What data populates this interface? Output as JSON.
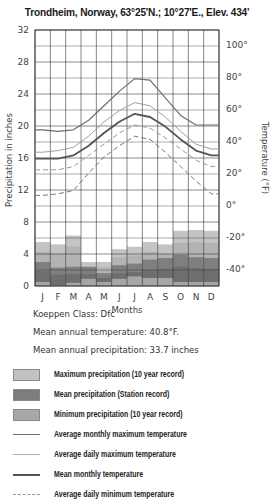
{
  "title": "Trondheim, Norway, 63°25'N.; 10°27'E., Elev. 434'",
  "info": {
    "koeppen": "Koeppen Class: Dfc",
    "mean_temp": "Mean annual temperature: 40.8°F.",
    "mean_precip": "Mean annual precipitation: 33.7 inches"
  },
  "legend": [
    {
      "label": "Maximum precipitation  (10 year record)",
      "kind": "swatch",
      "color": "#c2c2c2"
    },
    {
      "label": "Mean precipitation  (Station record)",
      "kind": "swatch",
      "color": "#7d7d7d"
    },
    {
      "label": "Minimum precipitation  (10 year record)",
      "kind": "swatch",
      "color": "#a8a8a8"
    },
    {
      "label": "Average monthly maximum temperature",
      "kind": "line",
      "color": "#6e6e6e",
      "width": 1.2,
      "dash": ""
    },
    {
      "label": "Average daily maximum temperature",
      "kind": "line",
      "color": "#a0a0a0",
      "width": 1,
      "dash": ""
    },
    {
      "label": "Mean monthly temperature",
      "kind": "line",
      "color": "#555555",
      "width": 1.8,
      "dash": ""
    },
    {
      "label": "Average daily minimum temperature",
      "kind": "line",
      "color": "#999999",
      "width": 1,
      "dash": "5,3"
    }
  ],
  "chart_data": {
    "type": "bar+line",
    "title": "Trondheim, Norway, 63°25'N.; 10°27'E., Elev. 434'",
    "xlabel": "Months",
    "ylabel": "Precipitation in inches",
    "y2label": "Temperature (°F)",
    "categories": [
      "J",
      "F",
      "M",
      "A",
      "M",
      "J",
      "J",
      "A",
      "S",
      "O",
      "N",
      "D"
    ],
    "ylim": [
      0,
      32
    ],
    "yticks": [
      0,
      4,
      8,
      12,
      16,
      20,
      24,
      28,
      32
    ],
    "y2lim": [
      -50,
      110
    ],
    "y2ticks": [
      "100°",
      "80°",
      "60°",
      "40°",
      "20°",
      "0°",
      "-20°",
      "-40°"
    ],
    "y2tick_values": [
      100,
      80,
      60,
      40,
      20,
      0,
      -20,
      -40
    ],
    "grid": true,
    "precipitation": {
      "max_10yr": [
        5.5,
        5.2,
        6.3,
        3.0,
        3.0,
        4.6,
        4.9,
        5.5,
        5.2,
        6.9,
        7.0,
        6.9
      ],
      "mean": [
        3.0,
        2.3,
        2.4,
        2.4,
        1.6,
        2.6,
        2.8,
        3.3,
        3.5,
        3.9,
        3.6,
        3.5
      ],
      "min_10yr": [
        0.5,
        0.1,
        0.4,
        0.9,
        0.5,
        0.9,
        1.2,
        1.0,
        1.0,
        0.5,
        0.5,
        0.5
      ]
    },
    "series": [
      {
        "name": "Average monthly maximum temperature",
        "values": [
          47,
          46,
          47,
          53,
          62,
          71,
          79,
          78,
          67,
          56,
          50,
          50
        ]
      },
      {
        "name": "Average daily maximum temperature",
        "values": [
          33,
          34,
          36,
          43,
          52,
          59,
          64,
          62,
          55,
          46,
          38,
          35
        ]
      },
      {
        "name": "Mean monthly temperature",
        "values": [
          29,
          29,
          31,
          37,
          45,
          52,
          57,
          55,
          49,
          41,
          34,
          31
        ]
      },
      {
        "name": "Average daily minimum temperature",
        "values": [
          22,
          22,
          24,
          31,
          38,
          45,
          50,
          48,
          42,
          35,
          28,
          24
        ]
      },
      {
        "name": "Average monthly minimum temperature",
        "values": [
          6,
          7,
          9,
          20,
          30,
          37,
          43,
          41,
          33,
          24,
          15,
          7
        ]
      }
    ]
  }
}
